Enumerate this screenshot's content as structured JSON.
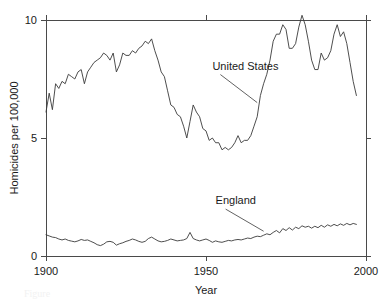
{
  "figure": {
    "background_color": "#ffffff",
    "line_color": "#3a3a3a",
    "axis_color": "#4a4a4a",
    "caption_partial": "Figure"
  },
  "axes": {
    "y_title": "Homicides per 100,000",
    "x_title": "Year",
    "y_ticks": [
      "0",
      "5",
      "10"
    ],
    "x_ticks": [
      "1900",
      "1950",
      "2000"
    ]
  },
  "annotations": {
    "united_states": "United States",
    "england": "England"
  },
  "chart_data": {
    "type": "line",
    "title": "",
    "subtitle": "",
    "xlabel": "Year",
    "ylabel": "Homicides per 100,000",
    "xlim": [
      1900,
      2000
    ],
    "ylim": [
      0,
      10
    ],
    "xticks": [
      1900,
      1950,
      2000
    ],
    "yticks": [
      0,
      5,
      10
    ],
    "grid": false,
    "legend_position": "inline-annotation",
    "annotations": [
      {
        "text": "United States",
        "x": 1952,
        "y": 7.9,
        "points_to_x": 1966,
        "points_to_y": 6.5
      },
      {
        "text": "England",
        "x": 1953,
        "y": 2.2,
        "points_to_x": 1968,
        "points_to_y": 1.05
      }
    ],
    "x": [
      1900,
      1901,
      1902,
      1903,
      1904,
      1905,
      1906,
      1907,
      1908,
      1909,
      1910,
      1911,
      1912,
      1913,
      1914,
      1915,
      1916,
      1917,
      1918,
      1919,
      1920,
      1921,
      1922,
      1923,
      1924,
      1925,
      1926,
      1927,
      1928,
      1929,
      1930,
      1931,
      1932,
      1933,
      1934,
      1935,
      1936,
      1937,
      1938,
      1939,
      1940,
      1941,
      1942,
      1943,
      1944,
      1945,
      1946,
      1947,
      1948,
      1949,
      1950,
      1951,
      1952,
      1953,
      1954,
      1955,
      1956,
      1957,
      1958,
      1959,
      1960,
      1961,
      1962,
      1963,
      1964,
      1965,
      1966,
      1967,
      1968,
      1969,
      1970,
      1971,
      1972,
      1973,
      1974,
      1975,
      1976,
      1977,
      1978,
      1979,
      1980,
      1981,
      1982,
      1983,
      1984,
      1985,
      1986,
      1987,
      1988,
      1989,
      1990,
      1991,
      1992,
      1993,
      1994,
      1995,
      1996,
      1997
    ],
    "series": [
      {
        "name": "United States",
        "values": [
          6.1,
          6.9,
          6.2,
          7.3,
          7.1,
          7.4,
          7.3,
          7.7,
          7.6,
          7.5,
          7.8,
          7.9,
          7.3,
          7.8,
          8.0,
          8.2,
          8.3,
          8.4,
          8.6,
          8.5,
          8.3,
          8.6,
          7.8,
          8.1,
          8.6,
          8.5,
          8.5,
          8.7,
          8.6,
          8.8,
          8.9,
          9.1,
          9.0,
          9.2,
          8.7,
          8.3,
          7.8,
          7.6,
          7.0,
          6.4,
          6.3,
          6.0,
          5.9,
          5.5,
          5.0,
          5.7,
          6.4,
          6.1,
          5.9,
          5.4,
          5.3,
          4.9,
          5.0,
          4.8,
          4.8,
          4.5,
          4.6,
          4.5,
          4.6,
          4.8,
          5.1,
          4.8,
          4.9,
          4.9,
          5.1,
          5.5,
          5.9,
          6.8,
          7.3,
          7.7,
          8.3,
          9.1,
          9.4,
          9.4,
          9.8,
          9.6,
          8.8,
          8.8,
          9.0,
          9.7,
          10.2,
          9.8,
          9.1,
          8.3,
          7.9,
          7.9,
          8.6,
          8.3,
          8.4,
          8.7,
          9.4,
          9.8,
          9.3,
          9.5,
          9.0,
          8.2,
          7.4,
          6.8
        ]
      },
      {
        "name": "England",
        "values": [
          0.9,
          0.85,
          0.8,
          0.78,
          0.72,
          0.68,
          0.72,
          0.66,
          0.63,
          0.6,
          0.64,
          0.7,
          0.66,
          0.68,
          0.62,
          0.56,
          0.48,
          0.44,
          0.5,
          0.6,
          0.62,
          0.58,
          0.46,
          0.52,
          0.56,
          0.62,
          0.66,
          0.72,
          0.68,
          0.62,
          0.58,
          0.62,
          0.74,
          0.8,
          0.72,
          0.64,
          0.6,
          0.62,
          0.66,
          0.72,
          0.68,
          0.64,
          0.66,
          0.68,
          0.74,
          1.0,
          0.74,
          0.68,
          0.64,
          0.68,
          0.72,
          0.66,
          0.58,
          0.64,
          0.6,
          0.58,
          0.62,
          0.66,
          0.64,
          0.68,
          0.7,
          0.68,
          0.72,
          0.76,
          0.74,
          0.8,
          0.84,
          0.82,
          0.88,
          0.94,
          0.9,
          1.0,
          1.08,
          0.98,
          1.16,
          1.08,
          1.2,
          1.1,
          1.22,
          1.16,
          1.28,
          1.22,
          1.26,
          1.18,
          1.26,
          1.2,
          1.3,
          1.22,
          1.32,
          1.26,
          1.34,
          1.28,
          1.36,
          1.3,
          1.38,
          1.32,
          1.38,
          1.34
        ]
      }
    ]
  }
}
